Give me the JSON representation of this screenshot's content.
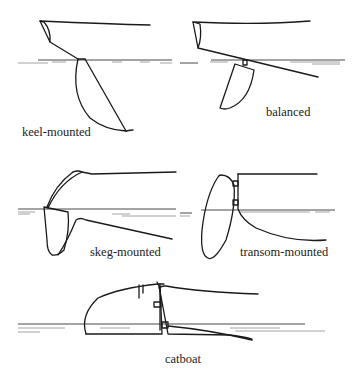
{
  "figure": {
    "panels": [
      {
        "id": "keel-mounted",
        "label": "keel-mounted"
      },
      {
        "id": "balanced",
        "label": "balanced"
      },
      {
        "id": "skeg-mounted",
        "label": "skeg-mounted"
      },
      {
        "id": "transom-mounted",
        "label": "transom-mounted"
      },
      {
        "id": "catboat",
        "label": "catboat"
      }
    ]
  }
}
